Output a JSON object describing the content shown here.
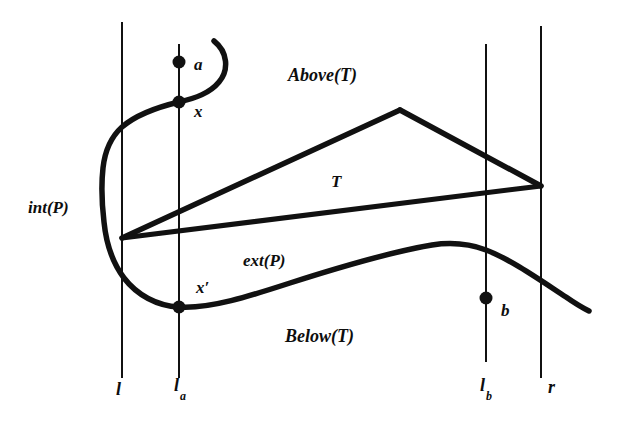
{
  "figure": {
    "type": "geometry-diagram",
    "background_color": "#ffffff",
    "ink_color": "#111111",
    "width": 617,
    "height": 432
  },
  "regions": {
    "above_t": "Above(T)",
    "below_t": "Below(T)",
    "interior_p": "int(P)",
    "exterior_p": "ext(P)"
  },
  "triangle": {
    "label": "T",
    "vertices": [
      {
        "name": "left-vertex",
        "x": 122,
        "y": 238
      },
      {
        "name": "apex-vertex",
        "x": 400,
        "y": 110
      },
      {
        "name": "right-vertex",
        "x": 541,
        "y": 186
      }
    ]
  },
  "points": [
    {
      "id": "a",
      "label": "a",
      "x": 179,
      "y": 62,
      "label_x": 194,
      "label_y": 58
    },
    {
      "id": "x",
      "label": "x",
      "x": 179,
      "y": 102,
      "label_x": 194,
      "label_y": 104
    },
    {
      "id": "xprime",
      "label": "x′",
      "x": 179,
      "y": 307,
      "label_x": 196,
      "label_y": 281
    },
    {
      "id": "b",
      "label": "b",
      "x": 486,
      "y": 298,
      "label_x": 501,
      "label_y": 304
    }
  ],
  "vertical_lines": [
    {
      "id": "l",
      "label": "l",
      "sub": "",
      "x": 122,
      "y1": 22,
      "y2": 378,
      "label_x": 116,
      "label_y": 386
    },
    {
      "id": "la",
      "label": "l",
      "sub": "a",
      "x": 179,
      "y1": 44,
      "y2": 378,
      "label_x": 175,
      "label_y": 383
    },
    {
      "id": "lb",
      "label": "l",
      "sub": "b",
      "x": 486,
      "y1": 44,
      "y2": 362,
      "label_x": 481,
      "label_y": 383
    },
    {
      "id": "r",
      "label": "r",
      "sub": "",
      "x": 541,
      "y1": 26,
      "y2": 378,
      "label_x": 549,
      "label_y": 384
    }
  ],
  "polygon_boundary": {
    "name": "P",
    "description": "thick wavy boundary curve of polygon P crossing the vertical lines"
  }
}
